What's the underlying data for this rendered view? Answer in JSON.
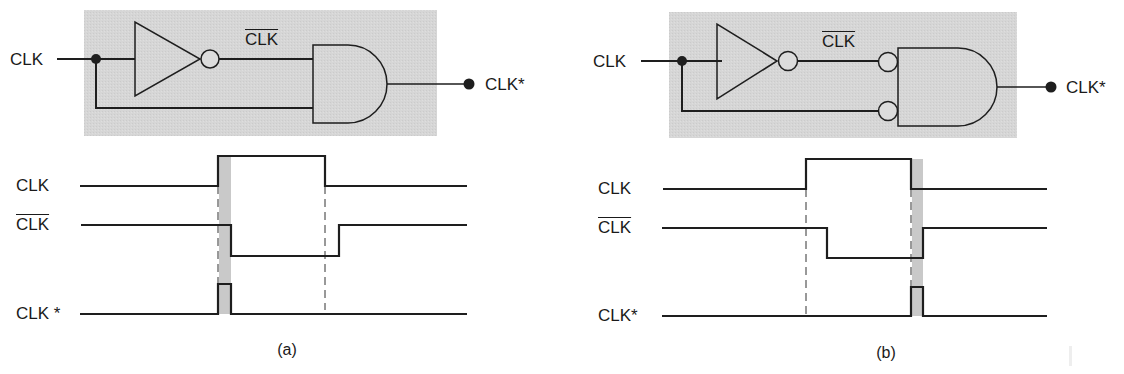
{
  "colors": {
    "panel_bg": "#d4d4d4",
    "line": "#1e1e1e",
    "highlight": "#c8c8c8",
    "background": "#ffffff"
  },
  "panels": [
    {
      "id": "a",
      "caption": "(a)",
      "circuit": {
        "input_label": "CLK",
        "inverted_signal_label": "CLK",
        "inverted_signal_overline": true,
        "output_label": "CLK*",
        "gates": [
          "inverter (NOT)",
          "AND"
        ],
        "and_input_bubbles": false
      },
      "timing": {
        "labels": [
          "CLK",
          "CLK",
          "CLK *"
        ],
        "label_overline": [
          false,
          true,
          false
        ],
        "signals": [
          {
            "name": "CLK",
            "transitions": [
              "low",
              "rise",
              "high",
              "fall",
              "low"
            ]
          },
          {
            "name": "CLK_bar",
            "transitions": [
              "high",
              "fall (delayed)",
              "low",
              "rise (delayed)",
              "high"
            ]
          },
          {
            "name": "CLK*",
            "transitions": [
              "low",
              "short pulse at CLK rising edge",
              "low"
            ]
          }
        ],
        "highlight": "glitch window after CLK rising edge"
      }
    },
    {
      "id": "b",
      "caption": "(b)",
      "circuit": {
        "input_label": "CLK",
        "inverted_signal_label": "CLK",
        "inverted_signal_overline": true,
        "output_label": "CLK*",
        "gates": [
          "inverter (NOT)",
          "AND with inverted inputs"
        ],
        "and_input_bubbles": true
      },
      "timing": {
        "labels": [
          "CLK",
          "CLK",
          "CLK*"
        ],
        "label_overline": [
          false,
          true,
          false
        ],
        "signals": [
          {
            "name": "CLK",
            "transitions": [
              "low",
              "rise",
              "high",
              "fall",
              "low"
            ]
          },
          {
            "name": "CLK_bar",
            "transitions": [
              "high",
              "fall (delayed)",
              "low",
              "rise (delayed)",
              "high"
            ]
          },
          {
            "name": "CLK*",
            "transitions": [
              "low",
              "short pulse at CLK falling edge",
              "low"
            ]
          }
        ],
        "highlight": "glitch window after CLK falling edge"
      }
    }
  ]
}
